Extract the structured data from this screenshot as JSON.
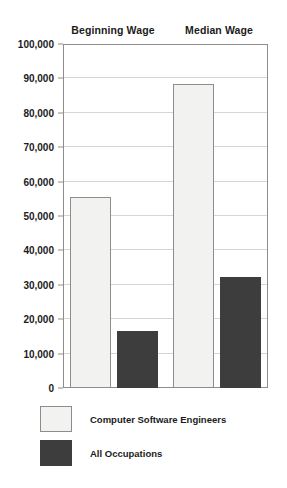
{
  "chart_data": {
    "type": "bar",
    "title": "",
    "subtitle": "",
    "xlabel": "",
    "ylabel": "",
    "categories": [
      "Beginning Wage",
      "Median Wage"
    ],
    "series": [
      {
        "name": "Computer Software Engineers",
        "color": "#f2f2f0",
        "values": [
          55400,
          88500
        ]
      },
      {
        "name": "All Occupations",
        "color": "#3d3d3d",
        "values": [
          16600,
          32200
        ]
      }
    ],
    "ylim": [
      0,
      100000
    ],
    "ytick_values": [
      0,
      10000,
      20000,
      30000,
      40000,
      50000,
      60000,
      70000,
      80000,
      90000,
      100000
    ],
    "ytick_labels": [
      "0",
      "10,000",
      "20,000",
      "30,000",
      "40,000",
      "50,000",
      "60,000",
      "70,000",
      "80,000",
      "90,000",
      "100,000"
    ],
    "grid": true,
    "grid_axis": "y",
    "legend_position": "bottom-left",
    "annotations": []
  },
  "legend": {
    "items": [
      {
        "label": "Computer Software Engineers",
        "swatch": "light"
      },
      {
        "label": "All Occupations",
        "swatch": "dark"
      }
    ]
  }
}
